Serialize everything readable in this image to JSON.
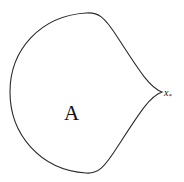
{
  "diagram": {
    "type": "closed-region-with-cusp",
    "stroke_color": "#2a2a2a",
    "background": "#ffffff",
    "region_label": "A",
    "point_label": {
      "base": "x",
      "subscript": "*"
    }
  }
}
